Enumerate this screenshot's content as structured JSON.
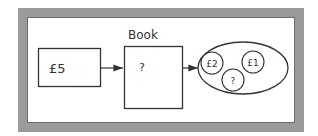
{
  "diagram": {
    "input_box": {
      "label": "£5"
    },
    "process_box": {
      "title": "Book",
      "label": "?"
    },
    "output_set": {
      "items": [
        {
          "label": "£2"
        },
        {
          "label": "£1"
        },
        {
          "label": "?"
        }
      ]
    },
    "colors": {
      "frame": "#9a9a9a",
      "stroke": "#333333",
      "background": "#ffffff"
    }
  }
}
